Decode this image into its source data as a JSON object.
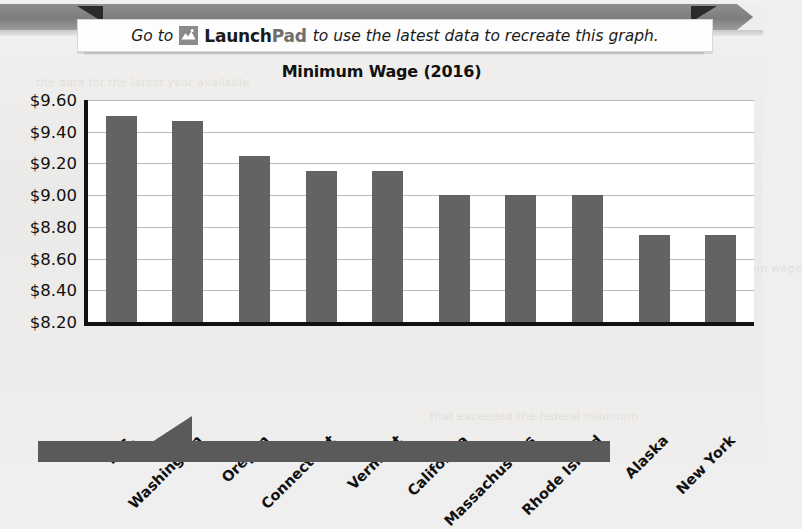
{
  "banner": {
    "text_before": "Go to",
    "icon": "launchpad-mountain-icon",
    "brand_part1": "Launch",
    "brand_part2": "Pad",
    "text_after": "to use the latest data to recreate this graph."
  },
  "chart_data": {
    "type": "bar",
    "title": "Minimum Wage (2016)",
    "xlabel": "",
    "ylabel": "",
    "categories": [
      "D.C.",
      "Washington",
      "Oregon",
      "Connecticut",
      "Vermont",
      "California",
      "Massachusetts",
      "Rhode Island",
      "Alaska",
      "New York"
    ],
    "values": [
      9.5,
      9.47,
      9.25,
      9.15,
      9.15,
      9.0,
      9.0,
      9.0,
      8.75,
      8.75
    ],
    "ylim": [
      8.2,
      9.6
    ],
    "ytick_step": 0.2,
    "ytick_labels": [
      "$9.60",
      "$9.40",
      "$9.20",
      "$9.00",
      "$8.80",
      "$8.60",
      "$8.40",
      "$8.20"
    ],
    "ytick_values": [
      9.6,
      9.4,
      9.2,
      9.0,
      8.8,
      8.6,
      8.4,
      8.2
    ],
    "grid": true,
    "legend": false,
    "bar_color": "#636363",
    "axis_color": "#111111",
    "plot_background": "#ffffff"
  },
  "decor": {
    "ghost_lines": [
      "the data for the latest year available",
      "of the states had a minimum wage",
      "that exceeded the federal minimum"
    ]
  }
}
